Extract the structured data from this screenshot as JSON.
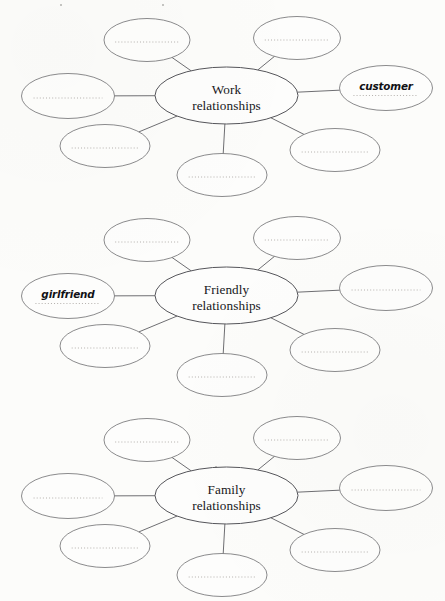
{
  "page": {
    "background_color": "#fcfcfa",
    "ink_color": "#5d5d62",
    "blank_line_color": "#b4b0ad"
  },
  "diagrams": [
    {
      "id": "work-relationships",
      "center_label_line1": "Work",
      "center_label_line2": "relationships",
      "nodes": [
        {
          "position": "top-left",
          "label": ""
        },
        {
          "position": "top-right",
          "label": ""
        },
        {
          "position": "left",
          "label": ""
        },
        {
          "position": "right",
          "label": "customer"
        },
        {
          "position": "bottom-left",
          "label": ""
        },
        {
          "position": "bottom-right",
          "label": ""
        },
        {
          "position": "bottom",
          "label": ""
        }
      ]
    },
    {
      "id": "friendly-relationships",
      "center_label_line1": "Friendly",
      "center_label_line2": "relationships",
      "nodes": [
        {
          "position": "top-left",
          "label": ""
        },
        {
          "position": "top-right",
          "label": ""
        },
        {
          "position": "left",
          "label": "girlfriend"
        },
        {
          "position": "right",
          "label": ""
        },
        {
          "position": "bottom-left",
          "label": ""
        },
        {
          "position": "bottom-right",
          "label": ""
        },
        {
          "position": "bottom",
          "label": ""
        }
      ]
    },
    {
      "id": "family-relationships",
      "center_label_line1": "Family",
      "center_label_line2": "relationships",
      "nodes": [
        {
          "position": "top-left",
          "label": ""
        },
        {
          "position": "top-right",
          "label": ""
        },
        {
          "position": "left",
          "label": ""
        },
        {
          "position": "right",
          "label": ""
        },
        {
          "position": "bottom-left",
          "label": ""
        },
        {
          "position": "bottom-right",
          "label": ""
        },
        {
          "position": "bottom",
          "label": ""
        }
      ]
    }
  ]
}
